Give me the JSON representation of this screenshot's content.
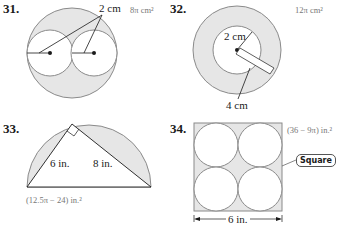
{
  "problems": [
    {
      "number": "31.",
      "answer": "8π cm²",
      "labels": [
        "2 cm"
      ]
    },
    {
      "number": "32.",
      "answer": "12π cm²",
      "labels": [
        "2 cm",
        "4 cm"
      ]
    },
    {
      "number": "33.",
      "answer": "(12.5π − 24) in.²",
      "labels": [
        "6 in.",
        "8 in."
      ]
    },
    {
      "number": "34.",
      "answer": "(36 − 9π) in.²",
      "labels": [
        "6 in."
      ],
      "callout": "Square"
    }
  ],
  "colors": {
    "shade": "#e6e6e6",
    "stroke": "#8a8a8a",
    "ink": "#1a1a1a"
  }
}
